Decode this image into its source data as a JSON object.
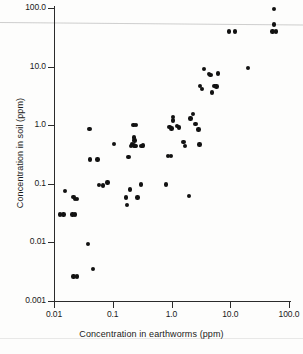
{
  "figure": {
    "kind": "scatter-plot",
    "background_color": "#fdfdfc",
    "marker_color": "#121212",
    "axis_color": "#2b2b2b"
  },
  "chart_data": {
    "type": "scatter",
    "title": "",
    "xlabel": "Concentration in earthworms (ppm)",
    "ylabel": "Concentration in soil (ppm)",
    "xscale": "log",
    "yscale": "log",
    "xlim": [
      0.01,
      100.0
    ],
    "ylim": [
      0.001,
      100.0
    ],
    "xticks": [
      0.01,
      0.1,
      1.0,
      10.0,
      100.0
    ],
    "xtick_labels": [
      "0.01",
      "0.1",
      "1.0",
      "10.0",
      "100.0"
    ],
    "yticks": [
      0.001,
      0.01,
      0.1,
      1.0,
      10.0,
      100.0
    ],
    "ytick_labels": [
      "0.001",
      "0.01",
      "0.1",
      "1.0",
      "10.0",
      "100.0"
    ],
    "grid": false,
    "legend": null,
    "series": [
      {
        "name": "soil vs earthworm concentration",
        "marker": "circle",
        "color": "#121212",
        "points": [
          [
            0.0125,
            0.03
          ],
          [
            0.0145,
            0.03
          ],
          [
            0.0155,
            0.075
          ],
          [
            0.0205,
            0.03
          ],
          [
            0.0225,
            0.03
          ],
          [
            0.0215,
            0.06
          ],
          [
            0.0225,
            0.055
          ],
          [
            0.0245,
            0.055
          ],
          [
            0.0215,
            0.0026
          ],
          [
            0.0245,
            0.0026
          ],
          [
            0.038,
            0.0095
          ],
          [
            0.04,
            0.86
          ],
          [
            0.041,
            0.26
          ],
          [
            0.046,
            0.0035
          ],
          [
            0.055,
            0.26
          ],
          [
            0.058,
            0.095
          ],
          [
            0.069,
            0.094
          ],
          [
            0.082,
            0.105
          ],
          [
            0.105,
            0.48
          ],
          [
            0.175,
            0.043
          ],
          [
            0.17,
            0.058
          ],
          [
            0.185,
            0.29
          ],
          [
            0.195,
            0.08
          ],
          [
            0.205,
            0.44
          ],
          [
            0.215,
            0.47
          ],
          [
            0.225,
            0.455
          ],
          [
            0.235,
            0.445
          ],
          [
            0.245,
            0.44
          ],
          [
            0.225,
            1.02
          ],
          [
            0.25,
            1.02
          ],
          [
            0.23,
            0.62
          ],
          [
            0.235,
            0.55
          ],
          [
            0.265,
            0.058
          ],
          [
            0.3,
            0.097
          ],
          [
            0.31,
            0.44
          ],
          [
            0.33,
            0.45
          ],
          [
            0.8,
            0.098
          ],
          [
            0.88,
            0.3
          ],
          [
            0.98,
            0.3
          ],
          [
            0.92,
            0.93
          ],
          [
            1.0,
            0.88
          ],
          [
            1.05,
            1.2
          ],
          [
            1.05,
            1.38
          ],
          [
            1.25,
            0.96
          ],
          [
            1.35,
            0.92
          ],
          [
            1.6,
            0.52
          ],
          [
            1.7,
            0.44
          ],
          [
            2.0,
            0.062
          ],
          [
            2.1,
            1.3
          ],
          [
            2.3,
            1.55
          ],
          [
            2.55,
            1.05
          ],
          [
            2.9,
            0.85
          ],
          [
            3.0,
            0.47
          ],
          [
            3.05,
            4.7
          ],
          [
            3.3,
            4.1
          ],
          [
            3.6,
            9.1
          ],
          [
            4.3,
            7.5
          ],
          [
            4.6,
            7.2
          ],
          [
            4.9,
            3.6
          ],
          [
            5.4,
            4.7
          ],
          [
            5.8,
            4.6
          ],
          [
            6.2,
            7.6
          ],
          [
            9.5,
            40.0
          ],
          [
            12.0,
            40.0
          ],
          [
            20.0,
            9.5
          ],
          [
            55.0,
            97.0
          ],
          [
            55.0,
            52.0
          ],
          [
            52.0,
            40.0
          ],
          [
            60.0,
            40.0
          ]
        ]
      }
    ]
  }
}
